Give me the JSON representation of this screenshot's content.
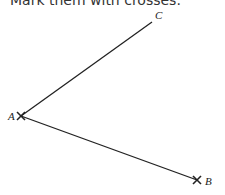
{
  "instruction": "Mark them with crosses.",
  "points": {
    "A": {
      "label": "A",
      "x": 21,
      "y": 116
    },
    "B": {
      "label": "B",
      "x": 197,
      "y": 180
    },
    "C": {
      "label": "C",
      "x": 152,
      "y": 22
    }
  },
  "colors": {
    "line": "#222222",
    "text": "#222222"
  }
}
